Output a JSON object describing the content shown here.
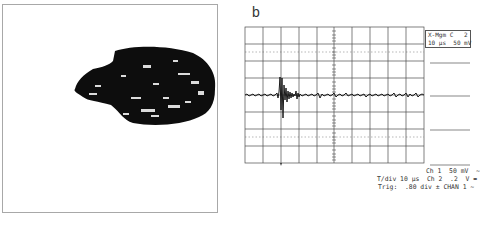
{
  "figure": {
    "panel_a": {
      "description": "binary image of dark irregular blob with speckles"
    },
    "panel_b": {
      "label": "b",
      "scope_box": {
        "line1": "X-Mgm C   2",
        "line2": "10 µs  50 mV"
      },
      "readouts": {
        "line1": "Ch 1  50 mV  ~",
        "line2": "T/div 10 µs  Ch 2  .2  V =",
        "line3": "Trig:  .80 div ± CHAN 1 ~"
      },
      "grid": {
        "cols": 10,
        "rows": 8
      }
    }
  },
  "colors": {
    "trace": "#1a1a1a",
    "grid": "#4a4a4a",
    "dotted": "#9a9a9a",
    "blob": "#0d0d0d",
    "frame": "#a8a8a8"
  }
}
